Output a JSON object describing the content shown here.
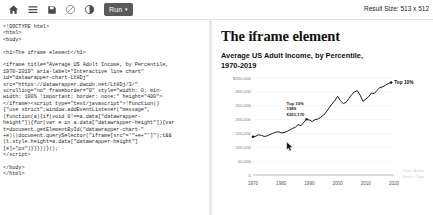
{
  "toolbar": {
    "icons": [
      {
        "name": "home-icon",
        "label": "Home"
      },
      {
        "name": "menu-icon",
        "label": "Menu"
      },
      {
        "name": "save-icon",
        "label": "Save"
      },
      {
        "name": "no-entry-icon",
        "label": "Disable"
      },
      {
        "name": "contrast-icon",
        "label": "Dark mode"
      }
    ],
    "run_label": "Run",
    "run_caret": "▾",
    "result_size": "Result Size: 513 x 512"
  },
  "editor": {
    "code": "<!DOCTYPE html>\n<html>\n<body>\n\n<h1>The iframe element</h1>\n\n<iframe title=\"Average US Adult Income, by Percentile,\n1970-2019\" aria-label=\"Interactive line chart\"\nid=\"datawrapper-chart-Lt8Dj\"\nsrc=\"https://datawrapper.dwcdn.net/Lt8Dj/3/\"\nscrolling=\"no\" frameborder=\"0\" style=\"width: 0; min-\nwidth: 100% !important; border: none;\" height=\"400\">\n</iframe><script type=\"text/javascript\">!function()\n{\"use strict\";window.addEventListener(\"message\",\n(function(a){if(void 0!==a.data[\"datawrapper-\nheight\"]){for(var e in a.data[\"datawrapper-height\"]){var\nt=document.getElementById(\"datawrapper-chart-\"\n+e)||document.querySelector(\"iframe[src*='\"+e+\"']\");t&&\n(t.style.height=a.data[\"datawrapper-height\"]\n[e]+\"px\")}}}))}();\n</script>\n\n</body>\n</html>"
  },
  "result": {
    "page_title": "The iframe element"
  },
  "chart_data": {
    "type": "line",
    "title": "Average US Adult Income, by Percentile, 1970-2019",
    "xlabel": "",
    "ylabel": "",
    "xlim": [
      1970,
      2020
    ],
    "ylim": [
      0,
      350000
    ],
    "grid": true,
    "legend_position": "end-of-line",
    "ytick_labels": [
      "$350,000",
      "300,000",
      "250,000",
      "200,000",
      "150,000",
      "100,000",
      "50,000",
      "0"
    ],
    "ytick_values": [
      350000,
      300000,
      250000,
      200000,
      150000,
      100000,
      50000,
      0
    ],
    "xtick_labels": [
      "1970",
      "1980",
      "1990",
      "2000",
      "2010",
      "2020"
    ],
    "xtick_values": [
      1970,
      1980,
      1990,
      2000,
      2010,
      2020
    ],
    "series": [
      {
        "name": "Top 10%",
        "color": "#1a1a1a",
        "x": [
          1970,
          1971,
          1972,
          1973,
          1974,
          1975,
          1976,
          1977,
          1978,
          1979,
          1980,
          1981,
          1982,
          1983,
          1984,
          1985,
          1986,
          1987,
          1988,
          1989,
          1990,
          1991,
          1992,
          1993,
          1994,
          1995,
          1996,
          1997,
          1998,
          1999,
          2000,
          2001,
          2002,
          2003,
          2004,
          2005,
          2006,
          2007,
          2008,
          2009,
          2010,
          2011,
          2012,
          2013,
          2014,
          2015,
          2016,
          2017,
          2018,
          2019
        ],
        "y": [
          138000,
          140000,
          145000,
          143000,
          139000,
          141000,
          146000,
          150000,
          154000,
          156000,
          152000,
          153000,
          157000,
          162000,
          168000,
          172000,
          182000,
          178000,
          190000,
          201170,
          198000,
          193000,
          200000,
          202000,
          208000,
          216000,
          228000,
          242000,
          256000,
          268000,
          284000,
          268000,
          258000,
          262000,
          276000,
          290000,
          300000,
          304000,
          288000,
          266000,
          274000,
          282000,
          296000,
          294000,
          306000,
          316000,
          318000,
          324000,
          330000,
          334000
        ]
      }
    ],
    "annotations": [
      {
        "name": "tooltip",
        "lines": [
          "Top 10%",
          "1989",
          "$201,170"
        ],
        "x": 1989,
        "y": 201170
      },
      {
        "name": "series-end-label",
        "text": "Top 10%",
        "x": 2019,
        "y": 334000
      }
    ],
    "credits": [
      "Chart: Author",
      "Source: Data"
    ]
  }
}
